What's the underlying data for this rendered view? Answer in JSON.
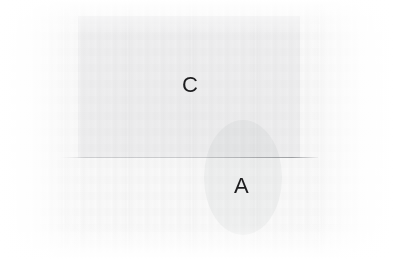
{
  "diagram": {
    "title": "",
    "background_color": "#ffffff",
    "shape_fill_color": "#f0f1f2",
    "line_color": "#858a8f",
    "label_color": "#1d1d1f",
    "shapes": [
      {
        "id": "rect-c",
        "kind": "rectangle",
        "label": "C",
        "x": 78,
        "y": 16,
        "width": 222,
        "height": 142,
        "fill": "#f2f3f4"
      },
      {
        "id": "circle-a",
        "kind": "circle",
        "label": "A",
        "x": 204,
        "y": 120,
        "width": 78,
        "height": 115,
        "fill": "#f2f3f4"
      }
    ],
    "lines": [
      {
        "id": "horizontal-divider",
        "kind": "line",
        "x1": 60,
        "y1": 157,
        "x2": 318,
        "y2": 157,
        "color": "#858a8f"
      }
    ],
    "labels": [
      {
        "id": "label-c",
        "text": "C",
        "x": 182,
        "y": 74
      },
      {
        "id": "label-a",
        "text": "A",
        "x": 234,
        "y": 175
      }
    ]
  }
}
